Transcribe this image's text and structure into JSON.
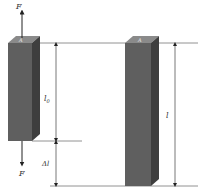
{
  "diagram": {
    "labels": {
      "force_top": "F",
      "force_bottom": "F",
      "original_length": "l",
      "original_length_sub": "0",
      "elongation": "Δl",
      "final_length": "l",
      "cross_section": "A"
    },
    "colors": {
      "bar_front": "#5f5f5f",
      "bar_side": "#3e3e3e",
      "bar_top": "#8a8a8a",
      "line": "#555555",
      "text": "#333333"
    }
  }
}
